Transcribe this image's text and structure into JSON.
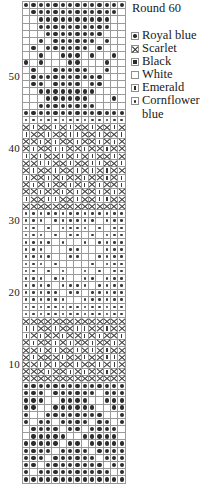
{
  "legend": {
    "title": "Round 60",
    "items": [
      {
        "symbol": "royal",
        "label": "Royal blue"
      },
      {
        "symbol": "scarlet",
        "label": "Scarlet"
      },
      {
        "symbol": "black",
        "label": "Black"
      },
      {
        "symbol": "white",
        "label": "White"
      },
      {
        "symbol": "emerald",
        "label": "Emerald"
      },
      {
        "symbol": "corn",
        "label": "Cornflower blue"
      }
    ]
  },
  "chart_data": {
    "type": "heatmap",
    "title": "Round 60",
    "xlabel": "",
    "ylabel": "Round",
    "columns": 14,
    "rows": 60,
    "row_labels": [
      "10",
      "20",
      "30",
      "40",
      "50"
    ],
    "row_label_rows": [
      10,
      20,
      30,
      40,
      50
    ],
    "grid": true,
    "legend_position": "right",
    "symbol_key": {
      "royal": "Royal blue",
      "scarlet": "Scarlet",
      "black": "Black",
      "white": "White",
      "emerald": "Emerald",
      "corn": "Cornflower blue"
    },
    "colors": {
      "symbol": "#2b2b2b",
      "gridline": "#9a9a9a",
      "background": "#ffffff",
      "text": "#1a1a1a"
    },
    "note": "Rows listed top (round 60) to bottom (round 1); each row is 14 cells of symbol codes.",
    "cells": [
      [
        "royal",
        "royal",
        "royal",
        "royal",
        "royal",
        "royal",
        "royal",
        "royal",
        "royal",
        "royal",
        "royal",
        "royal",
        "royal",
        "royal"
      ],
      [
        "white",
        "royal",
        "royal",
        "royal",
        "royal",
        "royal",
        "royal",
        "royal",
        "royal",
        "royal",
        "royal",
        "royal",
        "royal",
        "white"
      ],
      [
        "white",
        "white",
        "royal",
        "royal",
        "royal",
        "royal",
        "royal",
        "royal",
        "royal",
        "royal",
        "royal",
        "royal",
        "white",
        "white"
      ],
      [
        "white",
        "white",
        "royal",
        "royal",
        "royal",
        "royal",
        "royal",
        "royal",
        "royal",
        "royal",
        "royal",
        "royal",
        "white",
        "white"
      ],
      [
        "white",
        "white",
        "white",
        "royal",
        "royal",
        "royal",
        "royal",
        "royal",
        "royal",
        "royal",
        "royal",
        "white",
        "white",
        "white"
      ],
      [
        "white",
        "white",
        "royal",
        "white",
        "royal",
        "royal",
        "royal",
        "royal",
        "royal",
        "royal",
        "white",
        "royal",
        "white",
        "white"
      ],
      [
        "white",
        "royal",
        "white",
        "royal",
        "royal",
        "royal",
        "royal",
        "royal",
        "royal",
        "white",
        "royal",
        "white",
        "white",
        "white"
      ],
      [
        "white",
        "white",
        "royal",
        "white",
        "white",
        "royal",
        "royal",
        "royal",
        "white",
        "royal",
        "white",
        "white",
        "royal",
        "white"
      ],
      [
        "royal",
        "white",
        "royal",
        "white",
        "white",
        "white",
        "royal",
        "royal",
        "white",
        "white",
        "white",
        "royal",
        "white",
        "white"
      ],
      [
        "white",
        "royal",
        "white",
        "white",
        "royal",
        "royal",
        "royal",
        "royal",
        "royal",
        "white",
        "white",
        "royal",
        "white",
        "white"
      ],
      [
        "white",
        "royal",
        "royal",
        "royal",
        "royal",
        "royal",
        "royal",
        "royal",
        "royal",
        "royal",
        "royal",
        "white",
        "white",
        "white"
      ],
      [
        "white",
        "royal",
        "royal",
        "white",
        "royal",
        "royal",
        "royal",
        "royal",
        "white",
        "royal",
        "royal",
        "white",
        "white",
        "white"
      ],
      [
        "white",
        "white",
        "royal",
        "royal",
        "royal",
        "royal",
        "royal",
        "royal",
        "royal",
        "royal",
        "white",
        "white",
        "white",
        "white"
      ],
      [
        "white",
        "white",
        "white",
        "royal",
        "royal",
        "royal",
        "royal",
        "royal",
        "royal",
        "white",
        "white",
        "white",
        "royal",
        "white"
      ],
      [
        "white",
        "white",
        "royal",
        "royal",
        "royal",
        "royal",
        "royal",
        "royal",
        "royal",
        "royal",
        "white",
        "white",
        "white",
        "white"
      ],
      [
        "royal",
        "royal",
        "royal",
        "royal",
        "royal",
        "royal",
        "royal",
        "royal",
        "royal",
        "royal",
        "royal",
        "royal",
        "royal",
        "royal"
      ],
      [
        "corn",
        "corn",
        "corn",
        "corn",
        "corn",
        "corn",
        "corn",
        "corn",
        "corn",
        "corn",
        "corn",
        "corn",
        "corn",
        "corn"
      ],
      [
        "scarlet",
        "emerald",
        "scarlet",
        "scarlet",
        "emerald",
        "scarlet",
        "emerald",
        "scarlet",
        "scarlet",
        "emerald",
        "scarlet",
        "scarlet",
        "emerald",
        "scarlet"
      ],
      [
        "emerald",
        "scarlet",
        "scarlet",
        "emerald",
        "scarlet",
        "scarlet",
        "emerald",
        "emerald",
        "scarlet",
        "scarlet",
        "emerald",
        "scarlet",
        "scarlet",
        "emerald"
      ],
      [
        "scarlet",
        "scarlet",
        "emerald",
        "scarlet",
        "emerald",
        "scarlet",
        "scarlet",
        "emerald",
        "scarlet",
        "scarlet",
        "emerald",
        "scarlet",
        "emerald",
        "scarlet"
      ],
      [
        "scarlet",
        "emerald",
        "scarlet",
        "scarlet",
        "emerald",
        "emerald",
        "scarlet",
        "scarlet",
        "emerald",
        "scarlet",
        "scarlet",
        "emerald",
        "scarlet",
        "scarlet"
      ],
      [
        "emerald",
        "scarlet",
        "emerald",
        "scarlet",
        "scarlet",
        "emerald",
        "scarlet",
        "emerald",
        "scarlet",
        "emerald",
        "scarlet",
        "scarlet",
        "emerald",
        "scarlet"
      ],
      [
        "scarlet",
        "scarlet",
        "emerald",
        "emerald",
        "scarlet",
        "scarlet",
        "emerald",
        "scarlet",
        "scarlet",
        "emerald",
        "emerald",
        "scarlet",
        "scarlet",
        "emerald"
      ],
      [
        "scarlet",
        "emerald",
        "scarlet",
        "scarlet",
        "emerald",
        "scarlet",
        "scarlet",
        "emerald",
        "scarlet",
        "emerald",
        "scarlet",
        "emerald",
        "scarlet",
        "scarlet"
      ],
      [
        "emerald",
        "scarlet",
        "scarlet",
        "emerald",
        "scarlet",
        "emerald",
        "scarlet",
        "scarlet",
        "emerald",
        "scarlet",
        "scarlet",
        "emerald",
        "scarlet",
        "emerald"
      ],
      [
        "scarlet",
        "emerald",
        "scarlet",
        "emerald",
        "scarlet",
        "scarlet",
        "emerald",
        "scarlet",
        "emerald",
        "scarlet",
        "emerald",
        "scarlet",
        "scarlet",
        "emerald"
      ],
      [
        "scarlet",
        "scarlet",
        "emerald",
        "scarlet",
        "scarlet",
        "emerald",
        "scarlet",
        "emerald",
        "scarlet",
        "scarlet",
        "emerald",
        "scarlet",
        "emerald",
        "scarlet"
      ],
      [
        "emerald",
        "scarlet",
        "scarlet",
        "emerald",
        "emerald",
        "scarlet",
        "scarlet",
        "emerald",
        "scarlet",
        "scarlet",
        "emerald",
        "emerald",
        "scarlet",
        "scarlet"
      ],
      [
        "scarlet",
        "scarlet",
        "scarlet",
        "scarlet",
        "scarlet",
        "scarlet",
        "scarlet",
        "scarlet",
        "scarlet",
        "scarlet",
        "scarlet",
        "scarlet",
        "scarlet",
        "scarlet"
      ],
      [
        "corn",
        "corn",
        "corn",
        "corn",
        "corn",
        "corn",
        "corn",
        "corn",
        "corn",
        "corn",
        "corn",
        "corn",
        "corn",
        "corn"
      ],
      [
        "corn",
        "corn",
        "corn",
        "white",
        "corn",
        "corn",
        "corn",
        "corn",
        "corn",
        "corn",
        "white",
        "corn",
        "corn",
        "corn"
      ],
      [
        "corn",
        "corn",
        "white",
        "corn",
        "white",
        "corn",
        "corn",
        "corn",
        "corn",
        "white",
        "corn",
        "white",
        "corn",
        "corn"
      ],
      [
        "corn",
        "corn",
        "corn",
        "white",
        "corn",
        "white",
        "corn",
        "corn",
        "white",
        "corn",
        "white",
        "corn",
        "corn",
        "corn"
      ],
      [
        "corn",
        "corn",
        "corn",
        "corn",
        "white",
        "corn",
        "white",
        "white",
        "corn",
        "white",
        "corn",
        "corn",
        "corn",
        "corn"
      ],
      [
        "corn",
        "corn",
        "corn",
        "white",
        "white",
        "white",
        "corn",
        "corn",
        "white",
        "white",
        "white",
        "corn",
        "corn",
        "corn"
      ],
      [
        "corn",
        "corn",
        "corn",
        "corn",
        "white",
        "white",
        "corn",
        "corn",
        "white",
        "white",
        "corn",
        "corn",
        "corn",
        "corn"
      ],
      [
        "corn",
        "corn",
        "corn",
        "white",
        "corn",
        "white",
        "white",
        "white",
        "white",
        "corn",
        "white",
        "corn",
        "corn",
        "corn"
      ],
      [
        "corn",
        "corn",
        "white",
        "corn",
        "white",
        "corn",
        "white",
        "white",
        "corn",
        "white",
        "corn",
        "white",
        "corn",
        "corn"
      ],
      [
        "corn",
        "corn",
        "corn",
        "white",
        "corn",
        "corn",
        "white",
        "white",
        "corn",
        "corn",
        "white",
        "corn",
        "corn",
        "corn"
      ],
      [
        "corn",
        "corn",
        "corn",
        "corn",
        "white",
        "corn",
        "corn",
        "corn",
        "corn",
        "white",
        "corn",
        "corn",
        "corn",
        "corn"
      ],
      [
        "corn",
        "corn",
        "corn",
        "corn",
        "corn",
        "white",
        "corn",
        "corn",
        "white",
        "corn",
        "corn",
        "corn",
        "corn",
        "corn"
      ],
      [
        "corn",
        "corn",
        "corn",
        "corn",
        "corn",
        "corn",
        "white",
        "white",
        "corn",
        "corn",
        "corn",
        "corn",
        "corn",
        "corn"
      ],
      [
        "corn",
        "corn",
        "corn",
        "corn",
        "corn",
        "corn",
        "corn",
        "corn",
        "corn",
        "corn",
        "corn",
        "corn",
        "corn",
        "corn"
      ],
      [
        "corn",
        "corn",
        "corn",
        "corn",
        "corn",
        "corn",
        "corn",
        "corn",
        "corn",
        "corn",
        "corn",
        "corn",
        "corn",
        "corn"
      ],
      [
        "scarlet",
        "scarlet",
        "scarlet",
        "scarlet",
        "scarlet",
        "scarlet",
        "scarlet",
        "scarlet",
        "scarlet",
        "scarlet",
        "scarlet",
        "scarlet",
        "scarlet",
        "scarlet"
      ],
      [
        "emerald",
        "emerald",
        "scarlet",
        "scarlet",
        "emerald",
        "scarlet",
        "scarlet",
        "emerald",
        "emerald",
        "scarlet",
        "scarlet",
        "emerald",
        "scarlet",
        "scarlet"
      ],
      [
        "emerald",
        "scarlet",
        "emerald",
        "scarlet",
        "scarlet",
        "emerald",
        "scarlet",
        "scarlet",
        "emerald",
        "scarlet",
        "emerald",
        "scarlet",
        "scarlet",
        "emerald"
      ],
      [
        "scarlet",
        "emerald",
        "scarlet",
        "scarlet",
        "emerald",
        "scarlet",
        "emerald",
        "scarlet",
        "scarlet",
        "emerald",
        "scarlet",
        "scarlet",
        "emerald",
        "scarlet"
      ],
      [
        "scarlet",
        "scarlet",
        "emerald",
        "scarlet",
        "emerald",
        "scarlet",
        "scarlet",
        "emerald",
        "scarlet",
        "emerald",
        "scarlet",
        "emerald",
        "scarlet",
        "scarlet"
      ],
      [
        "scarlet",
        "emerald",
        "scarlet",
        "scarlet",
        "scarlet",
        "emerald",
        "scarlet",
        "scarlet",
        "emerald",
        "scarlet",
        "scarlet",
        "emerald",
        "emerald",
        "scarlet"
      ],
      [
        "scarlet",
        "scarlet",
        "emerald",
        "scarlet",
        "emerald",
        "scarlet",
        "scarlet",
        "emerald",
        "scarlet",
        "scarlet",
        "emerald",
        "scarlet",
        "emerald",
        "scarlet"
      ],
      [
        "scarlet",
        "scarlet",
        "scarlet",
        "emerald",
        "scarlet",
        "scarlet",
        "emerald",
        "scarlet",
        "emerald",
        "scarlet",
        "scarlet",
        "emerald",
        "scarlet",
        "scarlet"
      ],
      [
        "scarlet",
        "scarlet",
        "scarlet",
        "scarlet",
        "scarlet",
        "scarlet",
        "scarlet",
        "scarlet",
        "scarlet",
        "scarlet",
        "scarlet",
        "scarlet",
        "scarlet",
        "scarlet"
      ],
      [
        "royal",
        "royal",
        "royal",
        "royal",
        "royal",
        "royal",
        "royal",
        "royal",
        "royal",
        "royal",
        "royal",
        "royal",
        "royal",
        "royal"
      ],
      [
        "royal",
        "royal",
        "royal",
        "white",
        "royal",
        "royal",
        "royal",
        "royal",
        "royal",
        "royal",
        "white",
        "royal",
        "royal",
        "royal"
      ],
      [
        "royal",
        "royal",
        "royal",
        "white",
        "white",
        "royal",
        "royal",
        "royal",
        "royal",
        "white",
        "white",
        "royal",
        "royal",
        "royal"
      ],
      [
        "royal",
        "royal",
        "white",
        "white",
        "royal",
        "royal",
        "royal",
        "royal",
        "royal",
        "royal",
        "white",
        "white",
        "royal",
        "royal"
      ],
      [
        "royal",
        "white",
        "white",
        "royal",
        "royal",
        "royal",
        "royal",
        "royal",
        "royal",
        "royal",
        "royal",
        "white",
        "white",
        "royal"
      ],
      [
        "royal",
        "white",
        "royal",
        "royal",
        "white",
        "royal",
        "royal",
        "royal",
        "royal",
        "white",
        "royal",
        "royal",
        "white",
        "royal"
      ],
      [
        "white",
        "royal",
        "royal",
        "royal",
        "royal",
        "white",
        "royal",
        "royal",
        "white",
        "royal",
        "royal",
        "royal",
        "royal",
        "white"
      ],
      [
        "white",
        "royal",
        "royal",
        "royal",
        "royal",
        "royal",
        "white",
        "white",
        "royal",
        "royal",
        "royal",
        "royal",
        "royal",
        "white"
      ],
      [
        "royal",
        "royal",
        "royal",
        "royal",
        "royal",
        "white",
        "royal",
        "royal",
        "white",
        "royal",
        "royal",
        "royal",
        "royal",
        "royal"
      ],
      [
        "royal",
        "royal",
        "royal",
        "royal",
        "white",
        "royal",
        "royal",
        "royal",
        "royal",
        "white",
        "royal",
        "royal",
        "royal",
        "royal"
      ],
      [
        "royal",
        "royal",
        "royal",
        "white",
        "royal",
        "royal",
        "royal",
        "royal",
        "royal",
        "royal",
        "white",
        "royal",
        "royal",
        "royal"
      ],
      [
        "royal",
        "royal",
        "white",
        "royal",
        "royal",
        "royal",
        "royal",
        "royal",
        "royal",
        "royal",
        "royal",
        "white",
        "royal",
        "royal"
      ],
      [
        "royal",
        "white",
        "royal",
        "royal",
        "royal",
        "royal",
        "royal",
        "royal",
        "royal",
        "royal",
        "royal",
        "royal",
        "white",
        "royal"
      ],
      [
        "royal",
        "royal",
        "royal",
        "royal",
        "royal",
        "royal",
        "royal",
        "royal",
        "royal",
        "royal",
        "royal",
        "royal",
        "royal",
        "royal"
      ]
    ]
  }
}
